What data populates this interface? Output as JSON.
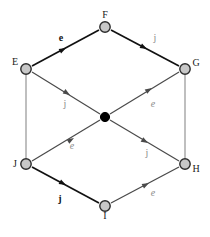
{
  "diagram": {
    "type": "directed-graph",
    "background_color": "#ffffff",
    "node_fill_color": "#c8c8c8",
    "node_stroke_color": "#2b2b2b",
    "center_node_color": "#000000",
    "bold_edge_color": "#111111",
    "light_edge_color": "#8a8a8a",
    "nodes": [
      {
        "id": "F",
        "label": "F",
        "x": 105,
        "y": 27,
        "style": "open",
        "label_dx": 0,
        "label_dy": -9
      },
      {
        "id": "E",
        "label": "E",
        "x": 26,
        "y": 69,
        "style": "open",
        "label_dx": -11,
        "label_dy": -4
      },
      {
        "id": "G",
        "label": "G",
        "x": 185,
        "y": 69,
        "style": "open",
        "label_dx": 11,
        "label_dy": -3
      },
      {
        "id": "C",
        "label": "",
        "x": 105,
        "y": 117,
        "style": "filled",
        "label_dx": 0,
        "label_dy": 0
      },
      {
        "id": "J",
        "label": "J",
        "x": 26,
        "y": 164,
        "style": "open",
        "label_dx": -11,
        "label_dy": 3
      },
      {
        "id": "H",
        "label": "H",
        "x": 185,
        "y": 164,
        "style": "open",
        "label_dx": 11,
        "label_dy": 8
      },
      {
        "id": "I",
        "label": "I",
        "x": 105,
        "y": 206,
        "style": "open",
        "label_dx": 0,
        "label_dy": 13
      }
    ],
    "edges": [
      {
        "id": "E-F",
        "from": "E",
        "to": "F",
        "label": "e",
        "label_style": "bold",
        "label_x": 61,
        "label_y": 41,
        "arrow": true,
        "weight": "bold"
      },
      {
        "id": "F-G",
        "from": "F",
        "to": "G",
        "label": "j",
        "label_style": "gray",
        "label_x": 155,
        "label_y": 41,
        "arrow": true,
        "weight": "bold"
      },
      {
        "id": "E-C",
        "from": "E",
        "to": "C",
        "label": "j",
        "label_style": "gray",
        "label_x": 65,
        "label_y": 107,
        "arrow": true,
        "weight": "light"
      },
      {
        "id": "C-G",
        "from": "C",
        "to": "G",
        "label": "e",
        "label_style": "gray",
        "label_x": 153,
        "label_y": 106,
        "arrow": true,
        "weight": "light"
      },
      {
        "id": "J-C",
        "from": "J",
        "to": "C",
        "label": "e",
        "label_style": "gray",
        "label_x": 72,
        "label_y": 148,
        "arrow": true,
        "weight": "light"
      },
      {
        "id": "C-H",
        "from": "C",
        "to": "H",
        "label": "j",
        "label_style": "gray",
        "label_x": 147,
        "label_y": 155,
        "arrow": true,
        "weight": "light"
      },
      {
        "id": "J-I",
        "from": "J",
        "to": "I",
        "label": "j",
        "label_style": "bold",
        "label_x": 60,
        "label_y": 201,
        "arrow": true,
        "weight": "bold"
      },
      {
        "id": "I-H",
        "from": "I",
        "to": "H",
        "label": "e",
        "label_style": "gray",
        "label_x": 153,
        "label_y": 196,
        "arrow": true,
        "weight": "light"
      },
      {
        "id": "E-J",
        "from": "E",
        "to": "J",
        "label": "",
        "label_style": "none",
        "label_x": 0,
        "label_y": 0,
        "arrow": false,
        "weight": "light"
      },
      {
        "id": "G-H",
        "from": "G",
        "to": "H",
        "label": "",
        "label_style": "none",
        "label_x": 0,
        "label_y": 0,
        "arrow": false,
        "weight": "light"
      }
    ]
  }
}
